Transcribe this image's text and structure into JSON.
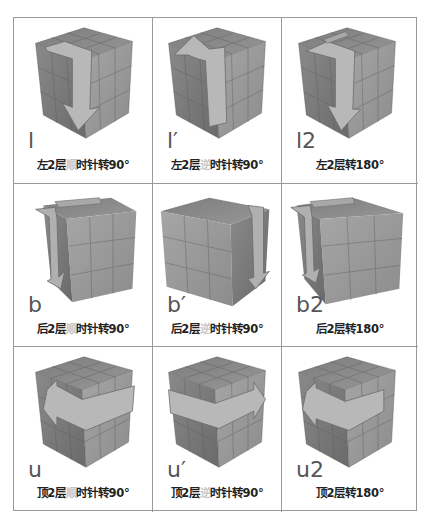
{
  "colors": {
    "grid_line": "#9a9a9a",
    "caption_text": "#222222",
    "caption_highlight": "#c8c8c8",
    "notation_text": "#555555",
    "cube_top": "#8a8a8a",
    "cube_left": "#7a7a7a",
    "cube_right": "#9a9a9a",
    "arrow": "#b4b4b4"
  },
  "cells": [
    {
      "notation": "l",
      "caption_pre": "左2层",
      "caption_hl": "顺",
      "caption_post": "时针转90°",
      "icon": "cube-left-layer-clockwise-arrow"
    },
    {
      "notation": "l′",
      "caption_pre": "左2层",
      "caption_hl": "逆",
      "caption_post": "时针转90°",
      "icon": "cube-left-layer-counterclockwise-arrow"
    },
    {
      "notation": "l2",
      "caption_pre": "左2层转180°",
      "caption_hl": "",
      "caption_post": "",
      "icon": "cube-left-layer-180-arrow"
    },
    {
      "notation": "b",
      "caption_pre": "后2层",
      "caption_hl": "顺",
      "caption_post": "时针转90°",
      "icon": "cube-back-layer-clockwise-arrow"
    },
    {
      "notation": "b′",
      "caption_pre": "后2层",
      "caption_hl": "逆",
      "caption_post": "时针转90°",
      "icon": "cube-back-layer-counterclockwise-arrow"
    },
    {
      "notation": "b2",
      "caption_pre": "后2层转180°",
      "caption_hl": "",
      "caption_post": "",
      "icon": "cube-back-layer-180-arrow"
    },
    {
      "notation": "u",
      "caption_pre": "顶2层",
      "caption_hl": "顺",
      "caption_post": "时针转90°",
      "icon": "cube-top-layer-clockwise-arrow"
    },
    {
      "notation": "u′",
      "caption_pre": "顶2层",
      "caption_hl": "逆",
      "caption_post": "时针转90°",
      "icon": "cube-top-layer-counterclockwise-arrow"
    },
    {
      "notation": "u2",
      "caption_pre": "顶2层转180°",
      "caption_hl": "",
      "caption_post": "",
      "icon": "cube-top-layer-180-arrow"
    }
  ]
}
